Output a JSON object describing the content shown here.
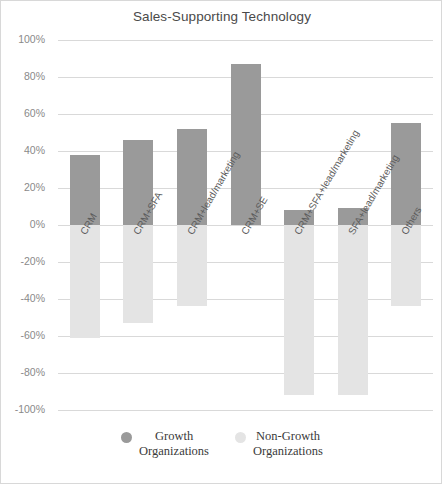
{
  "chart_data": {
    "type": "bar",
    "title": "Sales-Supporting Technology",
    "xlabel": "",
    "ylabel": "",
    "ylim": [
      -100,
      100
    ],
    "ytick_labels": [
      "100%",
      "80%",
      "60%",
      "40%",
      "20%",
      "0%",
      "-20%",
      "-40%",
      "-60%",
      "-80%",
      "-100%"
    ],
    "ytick_values": [
      100,
      80,
      60,
      40,
      20,
      0,
      -20,
      -40,
      -60,
      -80,
      -100
    ],
    "grid": true,
    "legend_position": "bottom",
    "categories": [
      "CRM",
      "CRM+SFA",
      "CRM+lead/marketing",
      "CRM+SE",
      "CRM+SFA+lead/marketing",
      "SFA+lead/marketing",
      "Others"
    ],
    "series": [
      {
        "name": "Growth Organizations",
        "color": "#9a9a9a",
        "values": [
          38,
          46,
          52,
          87,
          8,
          9,
          55
        ]
      },
      {
        "name": "Non-Growth Organizations",
        "color": "#e4e4e4",
        "values": [
          -61,
          -53,
          -44,
          0,
          -92,
          -92,
          -44
        ]
      }
    ]
  },
  "legend": {
    "entries": [
      {
        "label": "Growth\nOrganizations",
        "color": "#9a9a9a"
      },
      {
        "label": "Non-Growth\nOrganizations",
        "color": "#e4e4e4"
      }
    ]
  }
}
